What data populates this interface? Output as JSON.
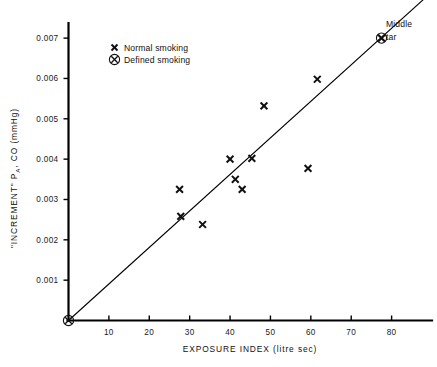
{
  "chart_data": {
    "type": "scatter",
    "title": "",
    "xlabel": "EXPOSURE INDEX   (litre sec)",
    "ylabel": "\"INCREMENT\" P_A, CO   (mmHg)",
    "ylabel_parts": {
      "prefix": "\"INCREMENT\"  P",
      "subscript": "A",
      "suffix": ", CO   (mmHg)"
    },
    "xlim": [
      0,
      90
    ],
    "ylim": [
      0,
      0.00735
    ],
    "xticks": [
      10,
      20,
      30,
      40,
      50,
      60,
      70,
      80
    ],
    "xtick_labels": [
      "10",
      "20",
      "30",
      "40",
      "50",
      "60",
      "70",
      "80"
    ],
    "yticks": [
      0.001,
      0.002,
      0.003,
      0.004,
      0.005,
      0.006,
      0.007
    ],
    "ytick_labels": [
      "0.001",
      "0.002",
      "0.003",
      "0.004",
      "0.005",
      "0.006",
      "0.007"
    ],
    "grid": false,
    "legend_position": "upper-left-inside",
    "series": [
      {
        "name": "Normal smoking",
        "marker": "cross",
        "points": [
          {
            "x": 27.5,
            "y": 0.00325
          },
          {
            "x": 27.8,
            "y": 0.00258
          },
          {
            "x": 33.2,
            "y": 0.00238
          },
          {
            "x": 40.0,
            "y": 0.004
          },
          {
            "x": 41.3,
            "y": 0.0035
          },
          {
            "x": 43.0,
            "y": 0.00325
          },
          {
            "x": 45.4,
            "y": 0.00402
          },
          {
            "x": 48.4,
            "y": 0.00532
          },
          {
            "x": 59.3,
            "y": 0.00377
          },
          {
            "x": 61.6,
            "y": 0.00598
          },
          {
            "x": 77.5,
            "y": 0.007
          }
        ]
      },
      {
        "name": "Defined smoking",
        "marker": "circled-cross",
        "points": [
          {
            "x": 0.0,
            "y": 0.0
          },
          {
            "x": 77.5,
            "y": 0.007
          }
        ]
      }
    ],
    "fit_line": {
      "name": "regression line through origin",
      "x_start": 0.0,
      "y_start": 0.0,
      "x_end": 90.0,
      "y_end": 0.00815
    },
    "annotations": [
      {
        "text": "Middle",
        "x": 80.5,
        "y": 0.0071
      },
      {
        "text": "tar",
        "x": 80.5,
        "y": 0.00645
      }
    ]
  },
  "legend": {
    "items": [
      {
        "marker": "cross",
        "label": "Normal smoking"
      },
      {
        "marker": "circled-cross",
        "label": "Defined smoking"
      }
    ]
  },
  "annotation": {
    "middle_tar_line1": "Middle",
    "middle_tar_line2": "tar"
  },
  "colors": {
    "ink": "#111111",
    "background": "#ffffff"
  }
}
